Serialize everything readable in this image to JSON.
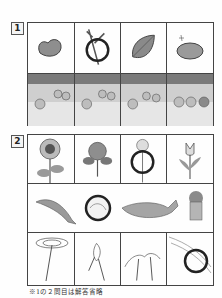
{
  "question1": {
    "number": "1",
    "top_row": [
      {
        "item": "heart-shaped stone",
        "circled": false
      },
      {
        "item": "twig",
        "circled": true
      },
      {
        "item": "leaf",
        "circled": false
      },
      {
        "item": "shiny nut/fruit",
        "circled": false
      }
    ],
    "bottom_row": [
      {
        "scene": "cats by the water"
      },
      {
        "scene": "cats by the water with sparkles"
      },
      {
        "scene": "cats by the water playing"
      },
      {
        "scene": "cats by the water, bear"
      }
    ]
  },
  "question2": {
    "number": "2",
    "row1": [
      {
        "item": "sunflower",
        "circled": false
      },
      {
        "item": "hydrangea",
        "circled": false
      },
      {
        "item": "cosmos",
        "circled": true
      },
      {
        "item": "tulip",
        "circled": false
      }
    ],
    "row2": [
      {
        "item": "dolphin",
        "circled": false
      },
      {
        "item": "mollusk/shell",
        "circled": true
      },
      {
        "item": "whale",
        "circled": false
      },
      {
        "item": "lion",
        "circled": false
      }
    ],
    "row3": [
      {
        "item": "hand spinning plate",
        "circled": false
      },
      {
        "item": "hand holding stick",
        "circled": false
      },
      {
        "item": "hands with string",
        "circled": false
      },
      {
        "item": "hand with thread",
        "circled": true
      }
    ]
  },
  "footnote": "※1の２問目は解答省略",
  "colors": {
    "line": "#444444",
    "circle": "#222222",
    "fill": "#9a9a9a",
    "bg": "#fefefe"
  }
}
